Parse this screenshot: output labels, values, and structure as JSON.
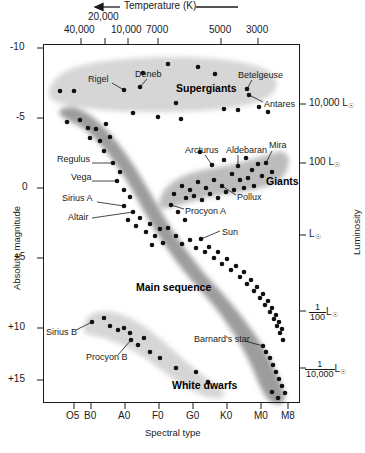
{
  "figure": {
    "kind": "hertzsprung-russell-diagram",
    "background": "#ffffff"
  },
  "axes": {
    "top": {
      "title": "Temperature (K)",
      "arrow": "left-arrow",
      "ticks": [
        {
          "label": "40,000",
          "x": 81
        },
        {
          "label": "20,000",
          "x": 105
        },
        {
          "label": "10,000",
          "x": 128
        },
        {
          "label": "7000",
          "x": 158
        },
        {
          "label": "5000",
          "x": 221
        },
        {
          "label": "3000",
          "x": 258
        }
      ]
    },
    "left": {
      "title": "Absolute magnitude",
      "ticks": [
        {
          "label": "-10",
          "y": 48
        },
        {
          "label": "-5",
          "y": 118
        },
        {
          "label": "0",
          "y": 188
        },
        {
          "label": "+5",
          "y": 258
        },
        {
          "label": "+10",
          "y": 328
        },
        {
          "label": "+15",
          "y": 380
        }
      ]
    },
    "right": {
      "title": "Luminosity",
      "ticks": [
        {
          "label": "10,000 L",
          "type": "plain",
          "y": 104
        },
        {
          "label": "100 L",
          "type": "plain",
          "y": 163
        },
        {
          "label": "L",
          "type": "plain",
          "y": 235
        },
        {
          "num": "1",
          "den": "100",
          "type": "fraction",
          "y": 311
        },
        {
          "num": "1",
          "den": "10,000",
          "type": "fraction",
          "y": 368
        }
      ]
    },
    "bottom": {
      "title": "Spectral type",
      "ticks": [
        {
          "label": "O5",
          "x": 74
        },
        {
          "label": "B0",
          "x": 91
        },
        {
          "label": "A0",
          "x": 125
        },
        {
          "label": "F0",
          "x": 159
        },
        {
          "label": "G0",
          "x": 193
        },
        {
          "label": "K0",
          "x": 227
        },
        {
          "label": "M0",
          "x": 261
        },
        {
          "label": "M8",
          "x": 288
        }
      ]
    }
  },
  "regions": [
    {
      "name": "Supergiants",
      "label_x": 176,
      "label_y": 88,
      "fill": "#d3d3d3"
    },
    {
      "name": "Giants",
      "label_x": 266,
      "label_y": 181,
      "fill": "#bdbdbd"
    },
    {
      "name": "Main sequence",
      "label_x": 136,
      "label_y": 287,
      "fill": "#9a9a9a"
    },
    {
      "name": "White dwarfs",
      "label_x": 172,
      "label_y": 385,
      "fill": "#d3d3d3"
    }
  ],
  "star_labels": [
    {
      "name": "Rigel",
      "tx": 88,
      "ty": 80,
      "lx": 112,
      "ly": 83,
      "px": 124,
      "py": 90
    },
    {
      "name": "Deneb",
      "tx": 135,
      "ty": 75,
      "lx": 147,
      "ly": 79,
      "px": 140,
      "py": 87
    },
    {
      "name": "Betelgeuse",
      "tx": 238,
      "ty": 76,
      "lx": 252,
      "ly": 80,
      "px": 247,
      "py": 89
    },
    {
      "name": "Antares",
      "tx": 264,
      "ty": 105,
      "lx": 263,
      "ly": 102,
      "px": 249,
      "py": 95
    },
    {
      "name": "Regulus",
      "tx": 57,
      "ty": 160,
      "lx": 92,
      "ly": 163,
      "px": 113,
      "py": 163
    },
    {
      "name": "Vega",
      "tx": 71,
      "ty": 178,
      "lx": 92,
      "ly": 181,
      "px": 117,
      "py": 181
    },
    {
      "name": "Sirius A",
      "tx": 62,
      "ty": 199,
      "lx": 97,
      "ly": 202,
      "px": 124,
      "py": 206
    },
    {
      "name": "Altair",
      "tx": 68,
      "ty": 218,
      "lx": 92,
      "ly": 218,
      "px": 133,
      "py": 212
    },
    {
      "name": "Arcturus",
      "tx": 185,
      "ty": 151,
      "lx": 205,
      "ly": 155,
      "px": 212,
      "py": 165
    },
    {
      "name": "Aldebaran",
      "tx": 226,
      "ty": 151,
      "lx": 238,
      "ly": 155,
      "px": 238,
      "py": 166
    },
    {
      "name": "Mira",
      "tx": 269,
      "ty": 146,
      "lx": 272,
      "ly": 151,
      "px": 266,
      "py": 163
    },
    {
      "name": "Pollux",
      "tx": 237,
      "ty": 198,
      "lx": 236,
      "ly": 195,
      "px": 222,
      "py": 186
    },
    {
      "name": "Procyon A",
      "tx": 185,
      "ty": 212,
      "lx": 184,
      "ly": 209,
      "px": 171,
      "py": 205
    },
    {
      "name": "Sun",
      "tx": 222,
      "ty": 233,
      "lx": 220,
      "ly": 231,
      "px": 201,
      "py": 239
    },
    {
      "name": "Sirius B",
      "tx": 46,
      "ty": 333,
      "lx": 76,
      "ly": 330,
      "px": 92,
      "py": 322
    },
    {
      "name": "Procyon B",
      "tx": 86,
      "ty": 358,
      "lx": 118,
      "ly": 355,
      "px": 131,
      "py": 340
    },
    {
      "name": "Barnard's star",
      "tx": 194,
      "ty": 340,
      "lx": 245,
      "ly": 341,
      "px": 263,
      "py": 346
    }
  ],
  "chart_data": {
    "type": "scatter",
    "xlabel": "Spectral type",
    "ylabel": "Absolute magnitude",
    "x2label": "Temperature (K)",
    "y2label": "Luminosity",
    "xticklabels": [
      "O5",
      "B0",
      "A0",
      "F0",
      "G0",
      "K0",
      "M0",
      "M8"
    ],
    "yticklabels": [
      "-10",
      "-5",
      "0",
      "+5",
      "+10",
      "+15"
    ],
    "x2ticklabels": [
      "40,000",
      "20,000",
      "10,000",
      "7000",
      "5000",
      "3000"
    ],
    "y2ticklabels": [
      "10,000 L",
      "100 L",
      "L",
      "1/100 L",
      "1/10,000 L"
    ],
    "grid": false,
    "legend": false,
    "named_stars": [
      {
        "name": "Rigel",
        "spectral_type": "B8",
        "abs_magnitude": -7.0,
        "group": "Supergiants"
      },
      {
        "name": "Deneb",
        "spectral_type": "A2",
        "abs_magnitude": -7.2,
        "group": "Supergiants"
      },
      {
        "name": "Betelgeuse",
        "spectral_type": "M2",
        "abs_magnitude": -5.6,
        "group": "Supergiants"
      },
      {
        "name": "Antares",
        "spectral_type": "M1",
        "abs_magnitude": -5.3,
        "group": "Supergiants"
      },
      {
        "name": "Regulus",
        "spectral_type": "B7",
        "abs_magnitude": -0.5,
        "group": "Main sequence"
      },
      {
        "name": "Vega",
        "spectral_type": "A0",
        "abs_magnitude": 0.6,
        "group": "Main sequence"
      },
      {
        "name": "Sirius A",
        "spectral_type": "A1",
        "abs_magnitude": 1.4,
        "group": "Main sequence"
      },
      {
        "name": "Altair",
        "spectral_type": "A7",
        "abs_magnitude": 2.2,
        "group": "Main sequence"
      },
      {
        "name": "Procyon A",
        "spectral_type": "F5",
        "abs_magnitude": 2.7,
        "group": "Main sequence"
      },
      {
        "name": "Sun",
        "spectral_type": "G2",
        "abs_magnitude": 4.8,
        "group": "Main sequence"
      },
      {
        "name": "Arcturus",
        "spectral_type": "K2",
        "abs_magnitude": -0.3,
        "group": "Giants"
      },
      {
        "name": "Aldebaran",
        "spectral_type": "K5",
        "abs_magnitude": -0.6,
        "group": "Giants"
      },
      {
        "name": "Mira",
        "spectral_type": "M7",
        "abs_magnitude": -0.8,
        "group": "Giants"
      },
      {
        "name": "Pollux",
        "spectral_type": "K0",
        "abs_magnitude": 1.1,
        "group": "Giants"
      },
      {
        "name": "Sirius B",
        "spectral_type": "A2",
        "abs_magnitude": 11.2,
        "group": "White dwarfs"
      },
      {
        "name": "Procyon B",
        "spectral_type": "F0",
        "abs_magnitude": 13.0,
        "group": "White dwarfs"
      },
      {
        "name": "Barnard's star",
        "spectral_type": "M4",
        "abs_magnitude": 13.2,
        "group": "Main sequence"
      }
    ],
    "points": [
      [
        143,
        73
      ],
      [
        168,
        64
      ],
      [
        198,
        67
      ],
      [
        215,
        74
      ],
      [
        60,
        91
      ],
      [
        74,
        91
      ],
      [
        124,
        90
      ],
      [
        140,
        87
      ],
      [
        176,
        103
      ],
      [
        181,
        119
      ],
      [
        247,
        89
      ],
      [
        249,
        95
      ],
      [
        224,
        109
      ],
      [
        238,
        110
      ],
      [
        259,
        107
      ],
      [
        268,
        112
      ],
      [
        158,
        117
      ],
      [
        133,
        113
      ],
      [
        67,
        122
      ],
      [
        80,
        120
      ],
      [
        88,
        128
      ],
      [
        96,
        129
      ],
      [
        106,
        124
      ],
      [
        90,
        138
      ],
      [
        100,
        141
      ],
      [
        110,
        137
      ],
      [
        104,
        151
      ],
      [
        113,
        163
      ],
      [
        117,
        181
      ],
      [
        120,
        172
      ],
      [
        124,
        190
      ],
      [
        124,
        206
      ],
      [
        130,
        197
      ],
      [
        133,
        212
      ],
      [
        128,
        220
      ],
      [
        136,
        226
      ],
      [
        140,
        218
      ],
      [
        146,
        232
      ],
      [
        150,
        224
      ],
      [
        155,
        236
      ],
      [
        160,
        229
      ],
      [
        152,
        245
      ],
      [
        163,
        243
      ],
      [
        171,
        205
      ],
      [
        178,
        212
      ],
      [
        185,
        220
      ],
      [
        168,
        228
      ],
      [
        176,
        236
      ],
      [
        182,
        244
      ],
      [
        190,
        240
      ],
      [
        196,
        248
      ],
      [
        201,
        239
      ],
      [
        205,
        252
      ],
      [
        209,
        247
      ],
      [
        214,
        258
      ],
      [
        218,
        252
      ],
      [
        222,
        264
      ],
      [
        227,
        259
      ],
      [
        231,
        270
      ],
      [
        236,
        266
      ],
      [
        240,
        277
      ],
      [
        244,
        272
      ],
      [
        247,
        284
      ],
      [
        251,
        280
      ],
      [
        254,
        291
      ],
      [
        257,
        287
      ],
      [
        260,
        298
      ],
      [
        263,
        294
      ],
      [
        265,
        305
      ],
      [
        268,
        301
      ],
      [
        270,
        312
      ],
      [
        272,
        308
      ],
      [
        274,
        319
      ],
      [
        276,
        315
      ],
      [
        277,
        326
      ],
      [
        279,
        322
      ],
      [
        280,
        333
      ],
      [
        282,
        329
      ],
      [
        283,
        340
      ],
      [
        263,
        346
      ],
      [
        266,
        352
      ],
      [
        270,
        358
      ],
      [
        273,
        365
      ],
      [
        276,
        372
      ],
      [
        279,
        379
      ],
      [
        282,
        386
      ],
      [
        285,
        393
      ],
      [
        272,
        392
      ],
      [
        278,
        398
      ],
      [
        200,
        152
      ],
      [
        212,
        165
      ],
      [
        224,
        160
      ],
      [
        238,
        166
      ],
      [
        246,
        158
      ],
      [
        252,
        170
      ],
      [
        258,
        164
      ],
      [
        266,
        163
      ],
      [
        272,
        172
      ],
      [
        262,
        176
      ],
      [
        248,
        178
      ],
      [
        240,
        180
      ],
      [
        232,
        174
      ],
      [
        222,
        186
      ],
      [
        214,
        180
      ],
      [
        206,
        188
      ],
      [
        198,
        182
      ],
      [
        190,
        190
      ],
      [
        182,
        186
      ],
      [
        174,
        194
      ],
      [
        186,
        198
      ],
      [
        194,
        196
      ],
      [
        202,
        200
      ],
      [
        210,
        194
      ],
      [
        218,
        198
      ],
      [
        226,
        192
      ],
      [
        234,
        190
      ],
      [
        244,
        188
      ],
      [
        254,
        186
      ],
      [
        92,
        322
      ],
      [
        104,
        318
      ],
      [
        110,
        326
      ],
      [
        118,
        330
      ],
      [
        124,
        328
      ],
      [
        130,
        333
      ],
      [
        131,
        340
      ],
      [
        138,
        345
      ],
      [
        144,
        338
      ],
      [
        150,
        352
      ],
      [
        160,
        358
      ],
      [
        176,
        368
      ],
      [
        196,
        372
      ],
      [
        208,
        382
      ]
    ]
  }
}
